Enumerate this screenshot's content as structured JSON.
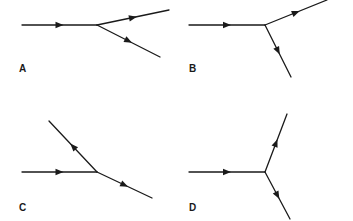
{
  "diagram": {
    "panels": [
      {
        "label": "A",
        "incoming": "from left",
        "branches": [
          {
            "direction": "up-right",
            "arrow": "outward"
          },
          {
            "direction": "down-right",
            "arrow": "outward"
          }
        ]
      },
      {
        "label": "B",
        "incoming": "from left",
        "branches": [
          {
            "direction": "up-right",
            "arrow": "outward"
          },
          {
            "direction": "steep down-right",
            "arrow": "outward"
          }
        ]
      },
      {
        "label": "C",
        "incoming": "from left",
        "branches": [
          {
            "direction": "up-left",
            "arrow": "outward"
          },
          {
            "direction": "down-right",
            "arrow": "outward"
          }
        ]
      },
      {
        "label": "D",
        "incoming": "from left",
        "branches": [
          {
            "direction": "steep up-right",
            "arrow": "outward"
          },
          {
            "direction": "steep down-right",
            "arrow": "outward"
          }
        ]
      }
    ],
    "line_color": "#1a1a1a"
  }
}
